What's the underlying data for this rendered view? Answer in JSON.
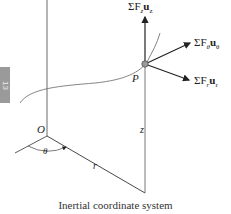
{
  "diagram": {
    "caption": "Inertial coordinate system",
    "side_tab": "13",
    "labels": {
      "origin": "O",
      "point": "P",
      "theta": "θ",
      "r": "r",
      "z": "z",
      "force_z": "ΣF",
      "force_z_sub": "z",
      "force_z_unit": "u",
      "force_z_unit_sub": "z",
      "force_theta": "ΣF",
      "force_theta_sub": "θ",
      "force_theta_unit": "u",
      "force_theta_unit_sub": "θ",
      "force_r": "ΣF",
      "force_r_sub": "r",
      "force_r_unit": "u",
      "force_r_unit_sub": "r"
    },
    "colors": {
      "line": "#333333",
      "curve": "#777777",
      "tab": "#9a9a9a"
    }
  }
}
